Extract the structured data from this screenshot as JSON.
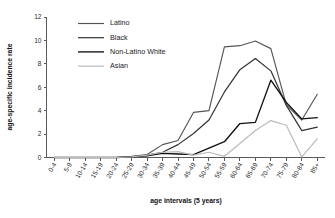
{
  "chart_data": {
    "type": "line",
    "title": "",
    "xlabel": "age intervals (5 years)",
    "ylabel": "age-specific incidence rate",
    "ylim": [
      0,
      12
    ],
    "yticks": [
      0,
      2,
      4,
      6,
      8,
      10,
      12
    ],
    "grid": false,
    "legend_position": "top-left-inside",
    "categories": [
      "0-4",
      "5-9",
      "10-14",
      "15-19",
      "20-24",
      "25-29",
      "30-34",
      "35-39",
      "40-44",
      "45-49",
      "50-54",
      "55-59",
      "60-64",
      "65-69",
      "70-74",
      "75-79",
      "80-84",
      "85+"
    ],
    "series": [
      {
        "name": "Latino",
        "color": "#555555",
        "values": [
          0,
          0,
          0,
          0,
          0,
          0.1,
          0.25,
          1.1,
          1.45,
          3.85,
          4.0,
          9.45,
          9.55,
          9.95,
          9.3,
          4.5,
          3.2,
          5.4
        ]
      },
      {
        "name": "Black",
        "color": "#333333",
        "values": [
          0,
          0,
          0,
          0,
          0,
          0.05,
          0.2,
          0.45,
          1.1,
          2.05,
          3.2,
          5.6,
          7.5,
          8.45,
          7.4,
          4.45,
          2.3,
          2.6
        ]
      },
      {
        "name": "Non-Latino White",
        "color": "#111111",
        "values": [
          0,
          0,
          0,
          0,
          0,
          0.05,
          0.15,
          0.35,
          0.3,
          0.25,
          0.8,
          1.35,
          2.9,
          3.0,
          6.6,
          4.7,
          3.3,
          3.4
        ]
      },
      {
        "name": "Asian",
        "color": "#bbbbbb",
        "values": [
          0,
          0,
          0,
          0,
          0,
          0.05,
          0.2,
          0.45,
          0.5,
          0.2,
          0.45,
          0.1,
          1.2,
          2.3,
          3.15,
          2.75,
          0.05,
          1.6
        ]
      }
    ]
  },
  "legend": {
    "entries": [
      {
        "label": "Latino"
      },
      {
        "label": "Black"
      },
      {
        "label": "Non-Latino White"
      },
      {
        "label": "Asian"
      }
    ]
  }
}
